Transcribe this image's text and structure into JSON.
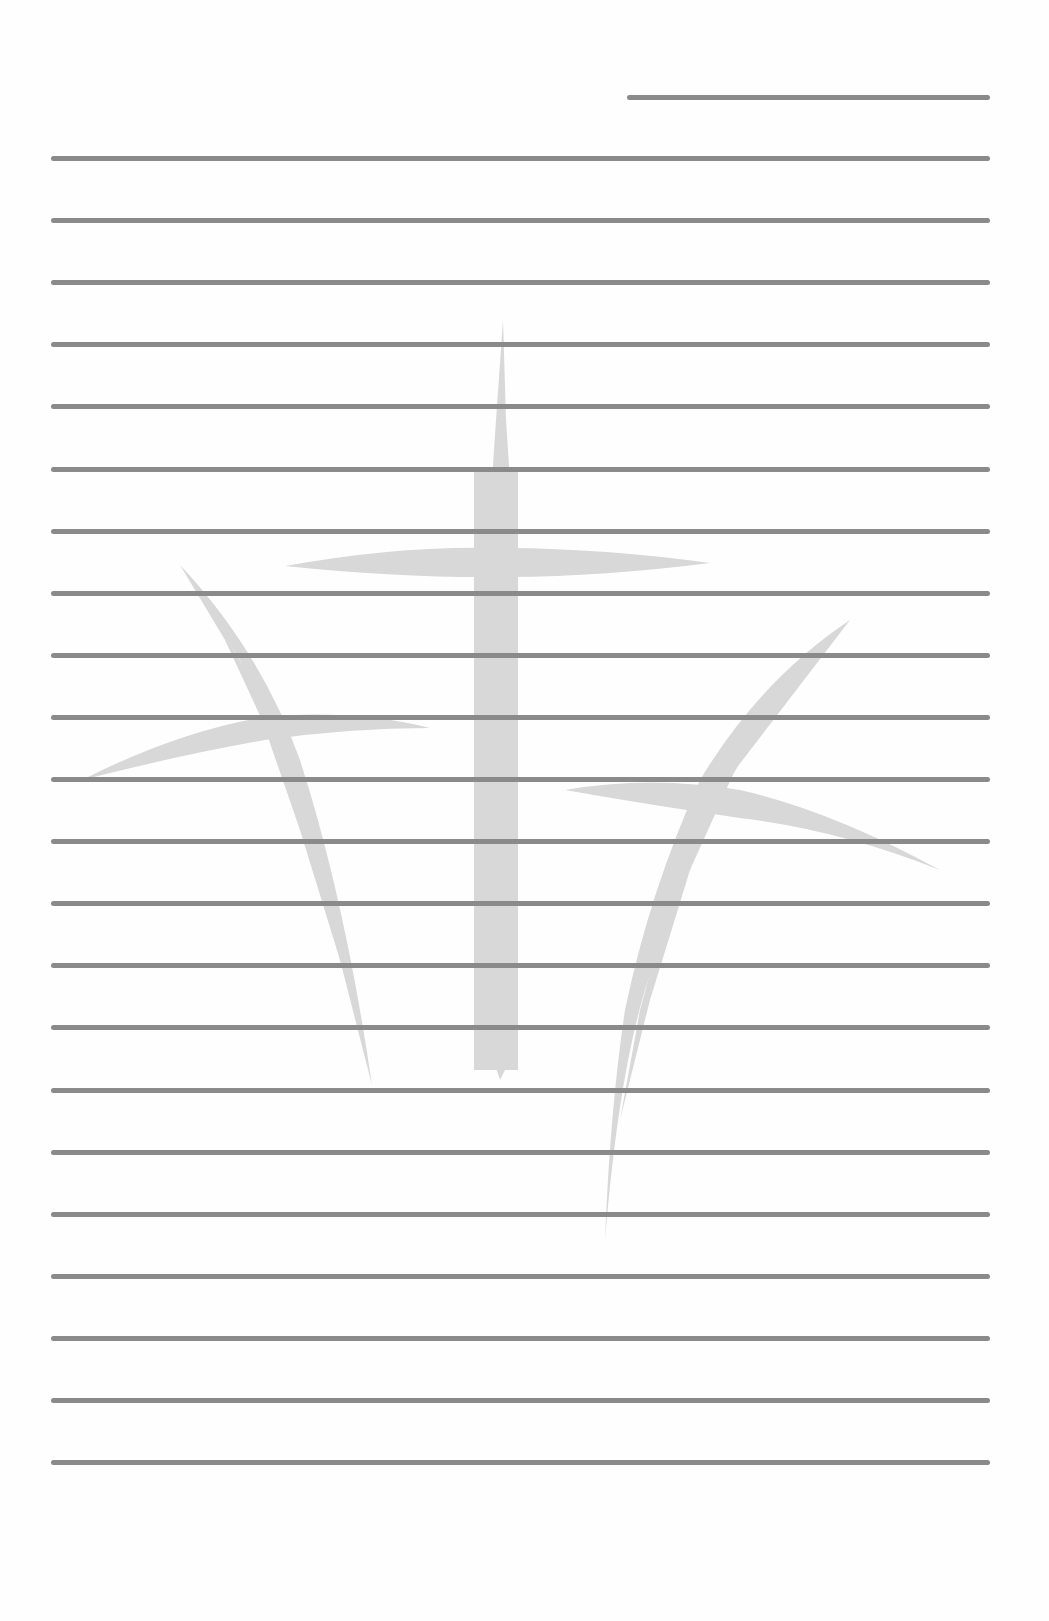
{
  "page": {
    "type": "lined stationery",
    "background_color": "#fefefe",
    "line_color": "#8a8a8a",
    "watermark_color": "#d4d4d4",
    "watermark": "three-crosses-icon",
    "short_header_line": {
      "x1": 627,
      "x2": 990,
      "y": 97
    },
    "lines": {
      "count": 22,
      "x1": 51,
      "x2": 990,
      "first_y": 158,
      "spacing": 62.1
    }
  }
}
